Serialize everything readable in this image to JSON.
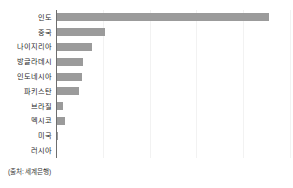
{
  "chart_data": {
    "type": "bar",
    "orientation": "horizontal",
    "title": "",
    "subtitle": "",
    "xlabel": "",
    "ylabel": "",
    "categories": [
      "인도",
      "중국",
      "나이지리아",
      "방글라데시",
      "인도네시아",
      "파키스탄",
      "브라질",
      "멕시코",
      "미국",
      "러시아"
    ],
    "values": [
      100,
      23,
      17,
      12.5,
      12,
      11,
      3.5,
      4,
      1,
      0.3
    ],
    "value_unit": "relative",
    "xlim": [
      0,
      110
    ],
    "gridlines": [
      0,
      22,
      44,
      66,
      88,
      110
    ],
    "grid": true,
    "legend": false,
    "bar_color": "#9b9b9b",
    "gridline_color": "#f2f2f2",
    "axis_color": "#6e6e6e",
    "background": "#ffffff"
  },
  "source": {
    "note": "(출처: 세계은행)"
  }
}
